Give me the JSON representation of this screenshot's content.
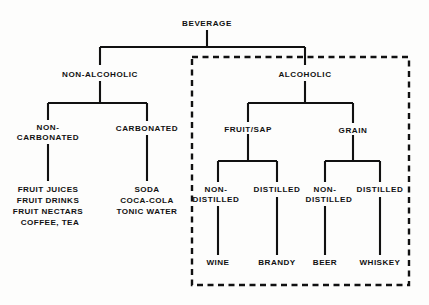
{
  "diagram": {
    "root": {
      "label": "BEVERAGE",
      "x": 207,
      "y": 26
    },
    "level1": [
      {
        "label": "NON-ALCOHOLIC",
        "x": 100,
        "y": 77
      },
      {
        "label": "ALCOHOLIC",
        "x": 305,
        "y": 77
      }
    ],
    "level2": [
      {
        "label_line1": "NON-",
        "label_line2": "CARBONATED",
        "x": 48,
        "y1": 130,
        "y2": 140
      },
      {
        "label_line1": "CARBONATED",
        "label_line2": "",
        "x": 147,
        "y1": 131,
        "y2": 0
      },
      {
        "label_line1": "FRUIT/SAP",
        "label_line2": "",
        "x": 248,
        "y1": 132,
        "y2": 0
      },
      {
        "label_line1": "GRAIN",
        "label_line2": "",
        "x": 353,
        "y1": 133,
        "y2": 0
      }
    ],
    "level3": [
      {
        "label_line1": "NON-",
        "label_line2": "DISTILLED",
        "x": 218,
        "y1": 192,
        "y2": 202
      },
      {
        "label_line1": "DISTILLED",
        "label_line2": "",
        "x": 277,
        "y1": 192,
        "y2": 0
      },
      {
        "label_line1": "NON-",
        "label_line2": "DISTILLED",
        "x": 325,
        "y1": 192,
        "y2": 202
      },
      {
        "label_line1": "DISTILLED",
        "label_line2": "",
        "x": 380,
        "y1": 192,
        "y2": 0
      }
    ],
    "leaves_alcoholic": [
      {
        "label": "WINE",
        "x": 218,
        "y": 265
      },
      {
        "label": "BRANDY",
        "x": 277,
        "y": 265
      },
      {
        "label": "BEER",
        "x": 325,
        "y": 265
      },
      {
        "label": "WHISKEY",
        "x": 380,
        "y": 265
      }
    ],
    "leaves_non_carbonated": {
      "x": 48,
      "y_start": 192,
      "line_height": 11,
      "items": [
        "FRUIT JUICES",
        "FRUIT DRINKS",
        "FRUIT NECTARS",
        "COFFEE, TEA"
      ]
    },
    "leaves_carbonated": {
      "x": 147,
      "y_start": 192,
      "line_height": 11,
      "items": [
        "SODA",
        "COCA-COLA",
        "TONIC WATER"
      ]
    },
    "dashed_region": {
      "name": "alcoholic-region",
      "x": 192,
      "y": 57,
      "width": 217,
      "height": 228
    },
    "colors": {
      "line": "#111111",
      "text": "#111111",
      "background": "#fdfdfc"
    }
  }
}
